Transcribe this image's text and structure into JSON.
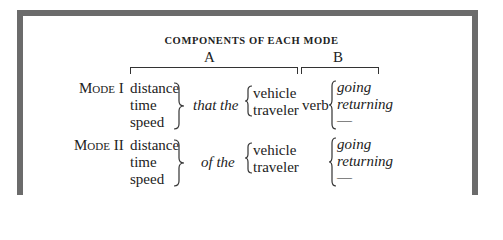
{
  "figure": {
    "title": "COMPONENTS OF EACH MODE",
    "column_a_label": "A",
    "column_b_label": "B",
    "rows": [
      {
        "mode_label": "Mode I",
        "components": [
          "distance",
          "time",
          "speed"
        ],
        "connector": "that the",
        "subjects": [
          "vehicle",
          "traveler"
        ],
        "verb_label": "verb",
        "directions": [
          "going",
          "returning",
          "—"
        ]
      },
      {
        "mode_label": "Mode II",
        "components": [
          "distance",
          "time",
          "speed"
        ],
        "connector": "of the",
        "subjects": [
          "vehicle",
          "traveler"
        ],
        "verb_label": "",
        "directions": [
          "going",
          "returning",
          "—"
        ]
      }
    ]
  },
  "colors": {
    "frame_border": "#6b6b6b",
    "text": "#222222",
    "background": "#ffffff"
  }
}
